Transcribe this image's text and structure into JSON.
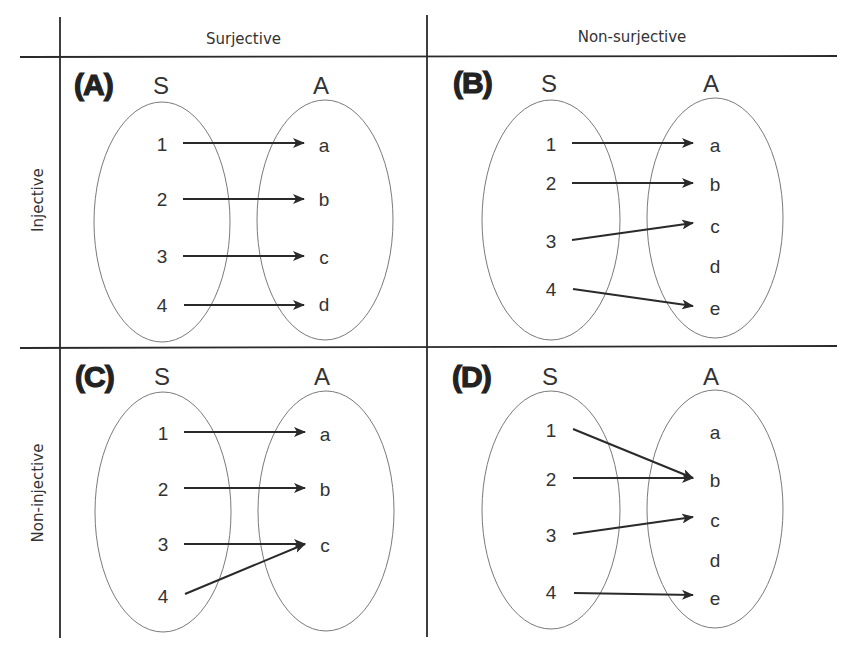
{
  "column_headers": [
    "Surjective",
    "Non-surjective"
  ],
  "row_headers": [
    "Injective",
    "Non-injective"
  ],
  "panels": [
    {
      "label": "(A)",
      "domain_label": "S",
      "codomain_label": "A",
      "domain": [
        "1",
        "2",
        "3",
        "4"
      ],
      "codomain": [
        "a",
        "b",
        "c",
        "d"
      ],
      "mapping": [
        [
          "1",
          "a"
        ],
        [
          "2",
          "b"
        ],
        [
          "3",
          "c"
        ],
        [
          "4",
          "d"
        ]
      ],
      "property": "injective, surjective"
    },
    {
      "label": "(B)",
      "domain_label": "S",
      "codomain_label": "A",
      "domain": [
        "1",
        "2",
        "3",
        "4"
      ],
      "codomain": [
        "a",
        "b",
        "c",
        "d",
        "e"
      ],
      "mapping": [
        [
          "1",
          "a"
        ],
        [
          "2",
          "b"
        ],
        [
          "3",
          "c"
        ],
        [
          "4",
          "e"
        ]
      ],
      "property": "injective, non-surjective"
    },
    {
      "label": "(C)",
      "domain_label": "S",
      "codomain_label": "A",
      "domain": [
        "1",
        "2",
        "3",
        "4"
      ],
      "codomain": [
        "a",
        "b",
        "c"
      ],
      "mapping": [
        [
          "1",
          "a"
        ],
        [
          "2",
          "b"
        ],
        [
          "3",
          "c"
        ],
        [
          "4",
          "c"
        ]
      ],
      "property": "non-injective, surjective"
    },
    {
      "label": "(D)",
      "domain_label": "S",
      "codomain_label": "A",
      "domain": [
        "1",
        "2",
        "3",
        "4"
      ],
      "codomain": [
        "a",
        "b",
        "c",
        "d",
        "e"
      ],
      "mapping": [
        [
          "1",
          "b"
        ],
        [
          "2",
          "b"
        ],
        [
          "3",
          "c"
        ],
        [
          "4",
          "e"
        ]
      ],
      "property": "non-injective, non-surjective"
    }
  ],
  "colors": {
    "line": "#2a2a2a",
    "ellipse": "#7a7a7a",
    "text": "#333333"
  }
}
